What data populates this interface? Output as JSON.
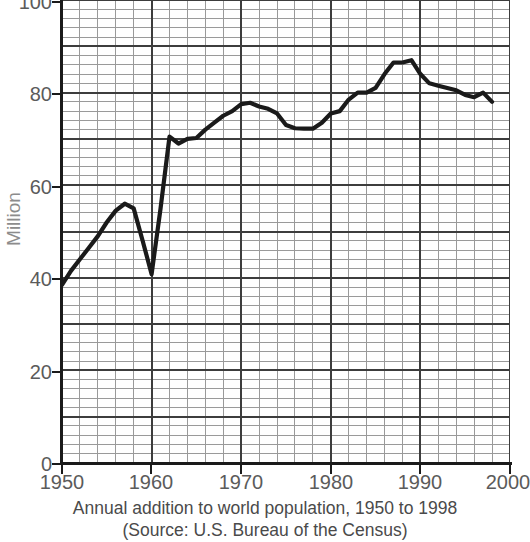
{
  "chart_data": {
    "type": "line",
    "title": "",
    "caption_line1": "Annual addition to world population, 1950 to 1998",
    "caption_line2": "(Source: U.S. Bureau of the Census)",
    "xlabel": "",
    "ylabel": "Million",
    "xlim": [
      1950,
      2000
    ],
    "ylim": [
      0,
      100
    ],
    "xticks": [
      1950,
      1960,
      1970,
      1980,
      1990,
      2000
    ],
    "xtick_labels": [
      "1950",
      "1960",
      "1970",
      "1980",
      "1990",
      "2000"
    ],
    "yticks": [
      0,
      20,
      40,
      60,
      80,
      100
    ],
    "ytick_labels": [
      "0",
      "20",
      "40",
      "60",
      "80",
      "100"
    ],
    "grid": true,
    "grid_minor_x_step": 2,
    "grid_minor_y_step": 2,
    "grid_major_x_step": 10,
    "grid_major_y_step": 10,
    "legend": null,
    "series": [
      {
        "name": "Annual addition to world population",
        "color": "#1a1a1a",
        "x": [
          1950,
          1951,
          1952,
          1953,
          1954,
          1955,
          1956,
          1957,
          1958,
          1959,
          1960,
          1961,
          1962,
          1963,
          1964,
          1965,
          1966,
          1967,
          1968,
          1969,
          1970,
          1971,
          1972,
          1973,
          1974,
          1975,
          1976,
          1977,
          1978,
          1979,
          1980,
          1981,
          1982,
          1983,
          1984,
          1985,
          1986,
          1987,
          1988,
          1989,
          1990,
          1991,
          1992,
          1993,
          1994,
          1995,
          1996,
          1997,
          1998
        ],
        "values": [
          38.5,
          41.5,
          44.0,
          46.5,
          49.0,
          52.0,
          54.5,
          56.0,
          55.0,
          48.0,
          40.8,
          55.0,
          70.5,
          69.0,
          70.0,
          70.2,
          72.0,
          73.5,
          75.0,
          76.0,
          77.5,
          77.8,
          77.0,
          76.5,
          75.5,
          73.0,
          72.3,
          72.2,
          72.2,
          73.5,
          75.5,
          76.0,
          78.5,
          80.0,
          80.0,
          81.0,
          84.0,
          86.5,
          86.5,
          87.0,
          84.0,
          82.0,
          81.5,
          81.0,
          80.5,
          79.5,
          79.0,
          80.0,
          78.0
        ]
      }
    ]
  },
  "axis": {
    "y_title": "Million",
    "y_title_color": "#8c8c8c",
    "tick_color": "#5b5b5b"
  },
  "colors": {
    "line": "#1a1a1a",
    "grid_minor": "#9a9a9a",
    "grid_major": "#3d3d3d",
    "axis": "#1a1a1a",
    "caption_text": "#4a4a4a"
  }
}
